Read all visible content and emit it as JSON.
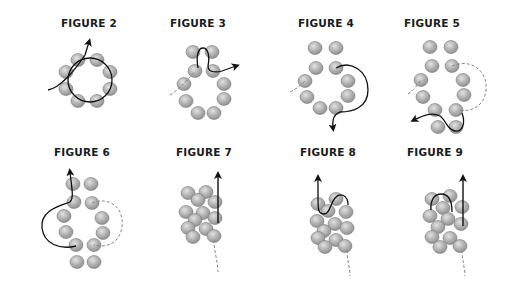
{
  "colors": {
    "background": "#ffffff",
    "bead_fill": "#a9a9a9",
    "bead_highlight": "#d6d6d6",
    "thread": "#111111",
    "thread_hidden": "#888888"
  },
  "figures": [
    {
      "id": "figure-2",
      "label": "FIGURE 2",
      "label_x": 89,
      "label_y": 17
    },
    {
      "id": "figure-3",
      "label": "FIGURE 3",
      "label_x": 198,
      "label_y": 17
    },
    {
      "id": "figure-4",
      "label": "FIGURE 4",
      "label_x": 326,
      "label_y": 17
    },
    {
      "id": "figure-5",
      "label": "FIGURE 5",
      "label_x": 432,
      "label_y": 17
    },
    {
      "id": "figure-6",
      "label": "FIGURE 6",
      "label_x": 82,
      "label_y": 146
    },
    {
      "id": "figure-7",
      "label": "FIGURE 7",
      "label_x": 204,
      "label_y": 146
    },
    {
      "id": "figure-8",
      "label": "FIGURE 8",
      "label_x": 328,
      "label_y": 146
    },
    {
      "id": "figure-9",
      "label": "FIGURE 9",
      "label_x": 435,
      "label_y": 146
    }
  ]
}
